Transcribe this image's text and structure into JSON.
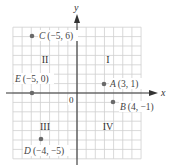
{
  "diagram": {
    "colors": {
      "grid": "#cfcfcf",
      "axis": "#333333",
      "point": "#6a6a6a",
      "label": "#444444"
    },
    "axes": {
      "x_label": "x",
      "y_label": "y",
      "origin_label": "0",
      "x_range": [
        -7,
        7
      ],
      "y_range": [
        -7,
        7
      ]
    },
    "quadrants": [
      {
        "label": "I",
        "x": 3.5,
        "y": 3.5
      },
      {
        "label": "II",
        "x": -3.5,
        "y": 3.5
      },
      {
        "label": "III",
        "x": -3.5,
        "y": -3.5
      },
      {
        "label": "IV",
        "x": 3.5,
        "y": -3.5
      }
    ],
    "points": [
      {
        "name": "A",
        "coords": "(3, 1)",
        "x": 3,
        "y": 1
      },
      {
        "name": "B",
        "coords": "(4, −1)",
        "x": 4,
        "y": -1
      },
      {
        "name": "C",
        "coords": "(−5, 6)",
        "x": -5,
        "y": 6
      },
      {
        "name": "D",
        "coords": "(−4, −5)",
        "x": -4,
        "y": -5
      },
      {
        "name": "E",
        "coords": "(−5, 0)",
        "x": -5,
        "y": 0
      }
    ]
  }
}
